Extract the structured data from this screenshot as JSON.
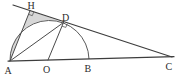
{
  "figure": {
    "type": "geometry-diagram",
    "labels": {
      "A": "A",
      "B": "B",
      "C": "C",
      "D": "D",
      "H": "H",
      "O": "O"
    },
    "elements": {
      "baseline": "A-O-B-C",
      "secant_tangent_line": "H-D-C",
      "segments": [
        "A-H",
        "A-D",
        "O-D"
      ],
      "arc": "semicircle on AB centered at O through D",
      "right_angle_marks": [
        "at H",
        "at D"
      ],
      "shaded_region": "bounded by AH, HD and arc DA"
    },
    "colors": {
      "line": "#3d3d3d",
      "arc": "#5a5a5a",
      "shade": "#d7d7d7",
      "label": "#2b2b2b",
      "background": "#ffffff"
    }
  }
}
